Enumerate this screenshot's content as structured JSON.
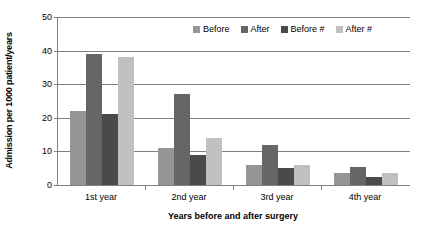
{
  "chart_data": {
    "type": "bar",
    "title": "",
    "xlabel": "Years before and after surgery",
    "ylabel": "Admission per 1000 patient/years",
    "categories": [
      "1st year",
      "2nd year",
      "3rd year",
      "4th year"
    ],
    "series": [
      {
        "name": "Before",
        "color": "#969696",
        "values": [
          22,
          11,
          6,
          3.5
        ]
      },
      {
        "name": "After",
        "color": "#666666",
        "values": [
          39,
          27,
          12,
          5.5
        ]
      },
      {
        "name": "Before  #",
        "color": "#4a4a4a",
        "values": [
          21,
          9,
          5,
          2.5
        ]
      },
      {
        "name": "After  #",
        "color": "#c0c0c0",
        "values": [
          38,
          14,
          6,
          3.5
        ]
      }
    ],
    "ylim": [
      0,
      50
    ],
    "ytick_values": [
      0,
      10,
      20,
      30,
      40,
      50
    ],
    "ytick_labels": [
      "0",
      "10",
      "20",
      "30",
      "40",
      "50"
    ],
    "grid": true,
    "legend_position": "top-right-inside"
  },
  "axis": {
    "y_title": "Admission per 1000 patient/years",
    "x_title": "Years before and after surgery",
    "y_labels": [
      "50",
      "40",
      "30",
      "20",
      "10",
      "0"
    ],
    "x_labels": [
      "1st year",
      "2nd year",
      "3rd year",
      "4th year"
    ]
  },
  "legend": {
    "items": [
      {
        "label": "Before"
      },
      {
        "label": "After"
      },
      {
        "label": "Before  #"
      },
      {
        "label": "After  #"
      }
    ]
  },
  "colors": {
    "series1": "#969696",
    "series2": "#666666",
    "series3": "#4a4a4a",
    "series4": "#c0c0c0",
    "axis": "#808080",
    "text": "#000000",
    "background": "#ffffff"
  }
}
